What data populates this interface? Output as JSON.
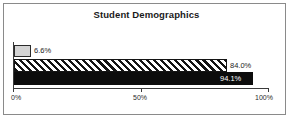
{
  "chart_data": {
    "type": "bar",
    "orientation": "horizontal",
    "title": "Student Demographics",
    "xlabel": "",
    "ylabel": "",
    "categories": [
      "Series 1",
      "Series 2",
      "Series 3"
    ],
    "values": [
      6.6,
      84.0,
      94.1
    ],
    "data_labels": [
      "6.6%",
      "84.0%",
      "94.1%"
    ],
    "xlim": [
      0,
      100
    ],
    "xticks": [
      0,
      50,
      100
    ],
    "xtick_labels": [
      "0%",
      "50%",
      "100%"
    ],
    "grid": false,
    "legend": false,
    "bar_styles": [
      {
        "name": "light-gray-solid",
        "fill": "#d4d4d4",
        "edge": "#2a2a2a",
        "label_position": "outside",
        "label_color": "#1c1c1c"
      },
      {
        "name": "diagonal-hatch",
        "fill": "#ffffff",
        "hatch": "//",
        "edge": "#141414",
        "label_position": "outside",
        "label_color": "#1c1c1c"
      },
      {
        "name": "black-solid",
        "fill": "#0c0c0c",
        "edge": "#0c0c0c",
        "label_position": "inside",
        "label_color": "#ffffff"
      }
    ],
    "colors": {
      "background": "#ffffff",
      "frame": "#8a8a8a",
      "axis": "#3a3a3a",
      "text": "#1a1a1a"
    }
  }
}
